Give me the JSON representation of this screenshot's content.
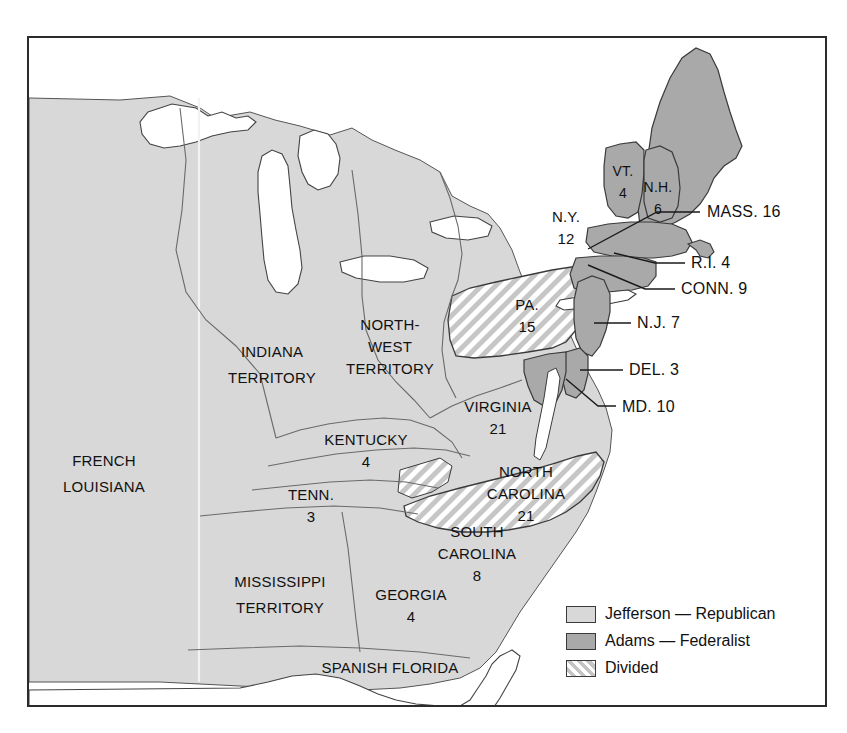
{
  "map": {
    "title": "Election of 1800",
    "colors": {
      "jefferson_fill": "#d8d8d8",
      "adams_fill": "#a9a9a9",
      "divided_stripe": "#c4c4c4",
      "water": "#ffffff",
      "border": "#2b2b2b",
      "outline": "#555555",
      "text": "#111111"
    },
    "regions": [
      {
        "id": "french-louisiana",
        "name": "FRENCH",
        "name2": "LOUISIANA",
        "votes": null,
        "category": "jefferson",
        "label_x": 104,
        "label_y": 466
      },
      {
        "id": "indiana-territory",
        "name": "INDIANA",
        "name2": "TERRITORY",
        "votes": null,
        "category": "jefferson",
        "label_x": 272,
        "label_y": 357
      },
      {
        "id": "northwest-territory",
        "name": "NORTH-",
        "name2": "WEST",
        "name3": "TERRITORY",
        "votes": null,
        "category": "jefferson",
        "label_x": 390,
        "label_y": 330
      },
      {
        "id": "mississippi-territory",
        "name": "MISSISSIPPI",
        "name2": "TERRITORY",
        "votes": null,
        "category": "jefferson",
        "label_x": 280,
        "label_y": 587
      },
      {
        "id": "spanish-florida",
        "name": "SPANISH  FLORIDA",
        "name2": null,
        "votes": null,
        "category": "jefferson",
        "label_x": 390,
        "label_y": 673
      },
      {
        "id": "kentucky",
        "name": "KENTUCKY",
        "name2": null,
        "votes": "4",
        "category": "jefferson",
        "label_x": 366,
        "label_y": 445
      },
      {
        "id": "tennessee",
        "name": "TENN.",
        "name2": null,
        "votes": "3",
        "category": "jefferson",
        "label_x": 311,
        "label_y": 500
      },
      {
        "id": "georgia",
        "name": "GEORGIA",
        "name2": null,
        "votes": "4",
        "category": "jefferson",
        "label_x": 411,
        "label_y": 600
      },
      {
        "id": "virginia",
        "name": "VIRGINIA",
        "name2": null,
        "votes": "21",
        "category": "jefferson",
        "label_x": 498,
        "label_y": 412
      },
      {
        "id": "north-carolina",
        "name": "NORTH",
        "name2": "CAROLINA",
        "votes": "21",
        "category": "divided",
        "label_x": 526,
        "label_y": 477
      },
      {
        "id": "south-carolina",
        "name": "SOUTH",
        "name2": "CAROLINA",
        "votes": "8",
        "category": "jefferson",
        "label_x": 477,
        "label_y": 537
      },
      {
        "id": "pennsylvania",
        "name": "PA.",
        "name2": null,
        "votes": "15",
        "category": "divided",
        "label_x": 527,
        "label_y": 310
      },
      {
        "id": "new-york",
        "name": "N.Y.",
        "name2": null,
        "votes": "12",
        "category": "jefferson",
        "label_x": 566,
        "label_y": 222
      },
      {
        "id": "vermont",
        "name": "VT.",
        "name2": null,
        "votes": "4",
        "category": "adams",
        "label_x": 623,
        "label_y": 176
      },
      {
        "id": "new-hampshire",
        "name": "N.H.",
        "name2": null,
        "votes": "6",
        "category": "adams",
        "label_x": 658,
        "label_y": 192
      }
    ],
    "callouts": [
      {
        "id": "massachusetts",
        "label": "MASS. 16",
        "category": "adams",
        "text_x": 707,
        "text_y": 217,
        "line": [
          [
            700,
            212
          ],
          [
            657,
            212
          ],
          [
            588,
            249
          ]
        ]
      },
      {
        "id": "rhode-island",
        "label": "R.I. 4",
        "category": "adams",
        "text_x": 691,
        "text_y": 268,
        "line": [
          [
            685,
            263
          ],
          [
            655,
            263
          ],
          [
            614,
            253
          ]
        ]
      },
      {
        "id": "connecticut",
        "label": "CONN. 9",
        "category": "adams",
        "text_x": 681,
        "text_y": 294,
        "line": [
          [
            675,
            289
          ],
          [
            645,
            289
          ],
          [
            588,
            265
          ]
        ]
      },
      {
        "id": "new-jersey",
        "label": "N.J. 7",
        "category": "adams",
        "text_x": 637,
        "text_y": 328,
        "line": [
          [
            631,
            323
          ],
          [
            594,
            323
          ]
        ]
      },
      {
        "id": "delaware",
        "label": "DEL. 3",
        "category": "adams",
        "text_x": 629,
        "text_y": 375,
        "line": [
          [
            623,
            370
          ],
          [
            580,
            370
          ]
        ]
      },
      {
        "id": "maryland",
        "label": "MD. 10",
        "category": "adams",
        "text_x": 622,
        "text_y": 412,
        "line": [
          [
            616,
            406
          ],
          [
            598,
            406
          ],
          [
            566,
            379
          ]
        ]
      }
    ],
    "legend": {
      "items": [
        {
          "id": "legend-jefferson",
          "swatch": "jefferson",
          "label": "Jefferson — Republican"
        },
        {
          "id": "legend-adams",
          "swatch": "adams",
          "label": "Adams — Federalist"
        },
        {
          "id": "legend-divided",
          "swatch": "divided",
          "label": "Divided"
        }
      ]
    }
  }
}
